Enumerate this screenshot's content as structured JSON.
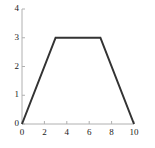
{
  "chart_data": {
    "type": "line",
    "title": "",
    "subtitle": "",
    "xlabel": "",
    "ylabel": "",
    "xlim": [
      0,
      10
    ],
    "ylim": [
      0,
      4
    ],
    "grid": false,
    "legend": null,
    "xticks": [
      0,
      2,
      4,
      6,
      8,
      10
    ],
    "xticklabels": [
      "0",
      "2",
      "4",
      "6",
      "8",
      "10"
    ],
    "yticks": [
      0,
      1,
      2,
      3,
      4
    ],
    "yticklabels": [
      "0",
      "1",
      "2",
      "3",
      "4"
    ],
    "series": [
      {
        "name": "trapezoid",
        "x": [
          0,
          3,
          7,
          10
        ],
        "y": [
          0,
          3,
          3,
          0
        ],
        "color": "#333333",
        "linewidth": 2
      }
    ],
    "annotations": [],
    "axis_color": "#b0b0b0",
    "tick_color": "#b0b0b0",
    "text_color": "#1a1a1a",
    "background": "#ffffff"
  }
}
